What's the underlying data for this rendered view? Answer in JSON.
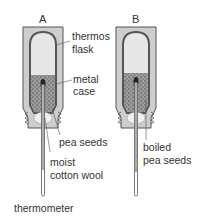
{
  "diagram": {
    "flask_a": {
      "heading": "A",
      "labels": {
        "thermos_flask": [
          "thermos",
          "flask"
        ],
        "metal_case": [
          "metal",
          "case"
        ],
        "pea_seeds": "pea seeds",
        "moist_cotton_wool": [
          "moist",
          "cotton wool"
        ],
        "thermometer": "thermometer"
      }
    },
    "flask_b": {
      "heading": "B",
      "labels": {
        "boiled_pea_seeds": [
          "boiled",
          "pea seeds"
        ]
      }
    },
    "colors": {
      "outline": "#555555",
      "case_fill": "#cfcfcf",
      "air_fill": "#e4e4e4",
      "seed_fill": "#8a8a8a",
      "cotton_fill": "#f0f0f0"
    }
  }
}
